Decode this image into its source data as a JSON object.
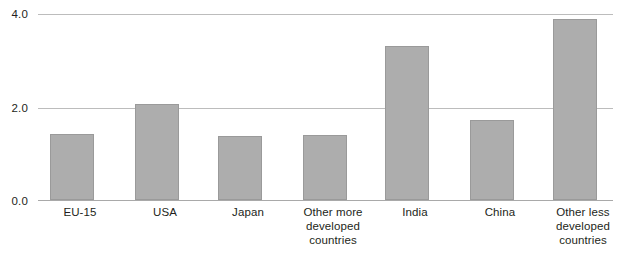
{
  "chart_data": {
    "type": "bar",
    "title": "",
    "subtitle": "",
    "xlabel": "",
    "ylabel": "",
    "ylim": [
      0,
      4.2
    ],
    "yticks": [
      0.0,
      2.0,
      4.0
    ],
    "ytick_labels": [
      "0.0",
      "2.0",
      "4.0"
    ],
    "grid": true,
    "legend": false,
    "categories": [
      "EU-15",
      "USA",
      "Japan",
      "Other more developed countries",
      "India",
      "China",
      "Other less developed countries"
    ],
    "category_lines": [
      [
        "EU-15"
      ],
      [
        "USA"
      ],
      [
        "Japan"
      ],
      [
        "Other more",
        "developed",
        "countries"
      ],
      [
        "India"
      ],
      [
        "China"
      ],
      [
        "Other less",
        "developed",
        "countries"
      ]
    ],
    "values": [
      1.42,
      2.08,
      1.38,
      1.4,
      3.34,
      1.72,
      3.91
    ],
    "bar_color": "#adadad",
    "bar_border_color": "#9a9a9a",
    "gridline_color": "#bcbcbc",
    "baseline_color": "#a9a9a9",
    "text_color": "#231f20"
  },
  "caption": {
    "partial_text": ""
  }
}
